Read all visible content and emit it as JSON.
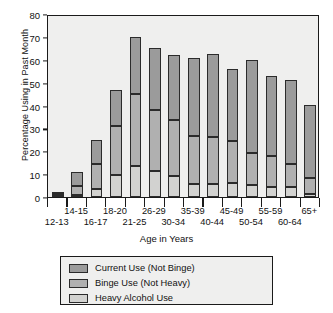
{
  "chart_data": {
    "type": "bar",
    "subtype": "stacked-vertical",
    "title": "",
    "xlabel": "Age in Years",
    "ylabel": "Percentage Using in Past Month",
    "ylim": [
      0,
      80
    ],
    "yticks": [
      0,
      10,
      20,
      30,
      40,
      50,
      60,
      70,
      80
    ],
    "grid": false,
    "legend_position": "bottom-center",
    "categories": [
      "12-13",
      "14-15",
      "16-17",
      "18-20",
      "21-25",
      "26-29",
      "30-34",
      "35-39",
      "40-44",
      "45-49",
      "50-54",
      "55-59",
      "60-64",
      "65+"
    ],
    "series": [
      {
        "name": "Heavy Alcohol Use",
        "color": "#d2d2d0",
        "values": [
          0.4,
          1.0,
          3.3,
          9.5,
          13.5,
          11.3,
          9.0,
          5.9,
          5.8,
          6.3,
          5.4,
          4.3,
          4.2,
          1.4
        ]
      },
      {
        "name": "Binge Use (Not Heavy)",
        "color": "#b0b0b0",
        "values": [
          1.0,
          4.0,
          11.3,
          21.5,
          31.5,
          26.8,
          24.5,
          20.9,
          20.6,
          18.1,
          13.9,
          13.6,
          10.1,
          6.8
        ]
      },
      {
        "name": "Current Use (Not Binge)",
        "color": "#9b9b9b",
        "values": [
          0.8,
          6.0,
          10.5,
          15.6,
          24.8,
          27.0,
          28.8,
          34.0,
          36.3,
          31.4,
          40.4,
          34.9,
          36.8,
          32.1
        ]
      }
    ],
    "totals": [
      2.2,
      11.0,
      25.1,
      46.6,
      69.8,
      65.1,
      62.3,
      60.8,
      62.7,
      55.8,
      59.7,
      52.8,
      51.1,
      40.3
    ],
    "stack_order_bottom_to_top": [
      "Heavy Alcohol Use",
      "Binge Use (Not Heavy)",
      "Current Use (Not Binge)"
    ]
  },
  "axes": {
    "y_title": "Percentage Using in Past Month",
    "x_title": "Age in Years",
    "y_tick_labels": [
      "0",
      "10",
      "20",
      "30",
      "40",
      "50",
      "60",
      "70",
      "80"
    ],
    "x_tick_labels": [
      "12-13",
      "14-15",
      "16-17",
      "18-20",
      "21-25",
      "26-29",
      "30-34",
      "35-39",
      "40-44",
      "45-49",
      "50-54",
      "55-59",
      "60-64",
      "65+"
    ]
  },
  "legend": {
    "items": [
      {
        "label": "Current Use (Not Binge)",
        "swatch": "current"
      },
      {
        "label": "Binge Use (Not Heavy)",
        "swatch": "binge"
      },
      {
        "label": "Heavy Alcohol Use",
        "swatch": "heavy"
      }
    ]
  },
  "colors": {
    "plot_background": "#efefee",
    "page_background": "#ffffff",
    "axis": "#1a1a1a",
    "current_use": "#9b9b9b",
    "binge_use": "#b0b0b0",
    "heavy_use": "#d2d2d0"
  }
}
